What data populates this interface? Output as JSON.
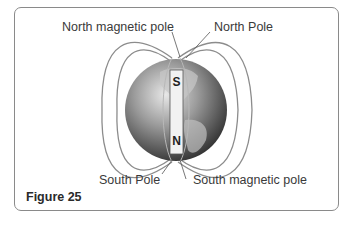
{
  "labels": {
    "north_magnetic_pole": "North magnetic pole",
    "north_pole": "North Pole",
    "south_pole": "South Pole",
    "south_magnetic_pole": "South magnetic pole"
  },
  "magnet": {
    "top_pole": "S",
    "bottom_pole": "N"
  },
  "figure_caption": "Figure 25"
}
